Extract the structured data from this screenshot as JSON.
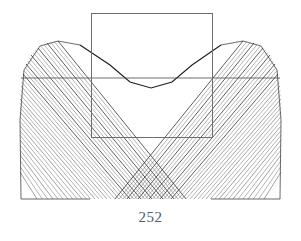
{
  "page": {
    "page_number": "252",
    "background_color": "#ffffff",
    "width": 301,
    "height": 241
  },
  "figure": {
    "caption": "",
    "ink_color": "#4a4a4a",
    "ink_color_dark": "#1e1e1e",
    "rectangle_color": "#6e6e6e",
    "envelope_color": "#5a5a5a"
  },
  "chart_data": {
    "type": "line",
    "title": "",
    "subtitle": "",
    "xlabel": "",
    "ylabel": "",
    "grid": false,
    "legend": null,
    "xlim": [
      0,
      301
    ],
    "ylim": [
      0,
      241
    ],
    "elements": [
      {
        "name": "rectangle-overlay",
        "type": "rect",
        "x": 91,
        "y": 13,
        "width": 121,
        "height": 124
      },
      {
        "name": "horizontal-chord",
        "type": "line",
        "x1": 21,
        "y1": 78,
        "x2": 280,
        "y2": 78
      },
      {
        "name": "left-lobe-outline",
        "type": "arc",
        "points": [
          [
            21,
            199
          ],
          [
            20,
            120
          ],
          [
            24,
            70
          ],
          [
            40,
            46
          ],
          [
            58,
            41
          ],
          [
            80,
            45
          ]
        ]
      },
      {
        "name": "right-lobe-outline",
        "type": "arc",
        "points": [
          [
            280,
            199
          ],
          [
            281,
            120
          ],
          [
            277,
            70
          ],
          [
            261,
            46
          ],
          [
            243,
            41
          ],
          [
            221,
            45
          ]
        ]
      },
      {
        "name": "envelope-upper-curve",
        "type": "curve",
        "points": [
          [
            80,
            45
          ],
          [
            110,
            65
          ],
          [
            130,
            82
          ],
          [
            151,
            88
          ],
          [
            172,
            82
          ],
          [
            192,
            65
          ],
          [
            221,
            45
          ]
        ]
      }
    ],
    "line_family": {
      "count": 26,
      "note": "Straight segments tangent to the parabolic envelope; left-hand pencil runs from upper-left arc down to the lower-right, right-hand pencil mirrored.",
      "left_pencil": [
        {
          "x1": 58,
          "y1": 41,
          "x2": 186,
          "y2": 199
        },
        {
          "x1": 47,
          "y1": 43,
          "x2": 174,
          "y2": 199
        },
        {
          "x1": 38,
          "y1": 48,
          "x2": 163,
          "y2": 199
        },
        {
          "x1": 31,
          "y1": 55,
          "x2": 152,
          "y2": 199
        },
        {
          "x1": 26,
          "y1": 64,
          "x2": 141,
          "y2": 199
        },
        {
          "x1": 23,
          "y1": 74,
          "x2": 130,
          "y2": 199
        },
        {
          "x1": 21,
          "y1": 86,
          "x2": 119,
          "y2": 199
        },
        {
          "x1": 20,
          "y1": 99,
          "x2": 107,
          "y2": 199
        },
        {
          "x1": 20,
          "y1": 112,
          "x2": 95,
          "y2": 199
        },
        {
          "x1": 20,
          "y1": 126,
          "x2": 82,
          "y2": 199
        },
        {
          "x1": 20,
          "y1": 140,
          "x2": 68,
          "y2": 199
        },
        {
          "x1": 20,
          "y1": 155,
          "x2": 53,
          "y2": 199
        },
        {
          "x1": 20,
          "y1": 172,
          "x2": 37,
          "y2": 199
        }
      ],
      "right_pencil": [
        {
          "x1": 243,
          "y1": 41,
          "x2": 115,
          "y2": 199
        },
        {
          "x1": 254,
          "y1": 43,
          "x2": 127,
          "y2": 199
        },
        {
          "x1": 263,
          "y1": 48,
          "x2": 138,
          "y2": 199
        },
        {
          "x1": 270,
          "y1": 55,
          "x2": 149,
          "y2": 199
        },
        {
          "x1": 275,
          "y1": 64,
          "x2": 160,
          "y2": 199
        },
        {
          "x1": 278,
          "y1": 74,
          "x2": 171,
          "y2": 199
        },
        {
          "x1": 280,
          "y1": 86,
          "x2": 182,
          "y2": 199
        },
        {
          "x1": 281,
          "y1": 99,
          "x2": 194,
          "y2": 199
        },
        {
          "x1": 281,
          "y1": 112,
          "x2": 206,
          "y2": 199
        },
        {
          "x1": 281,
          "y1": 126,
          "x2": 219,
          "y2": 199
        },
        {
          "x1": 281,
          "y1": 140,
          "x2": 233,
          "y2": 199
        },
        {
          "x1": 281,
          "y1": 155,
          "x2": 248,
          "y2": 199
        },
        {
          "x1": 281,
          "y1": 172,
          "x2": 264,
          "y2": 199
        }
      ]
    }
  }
}
